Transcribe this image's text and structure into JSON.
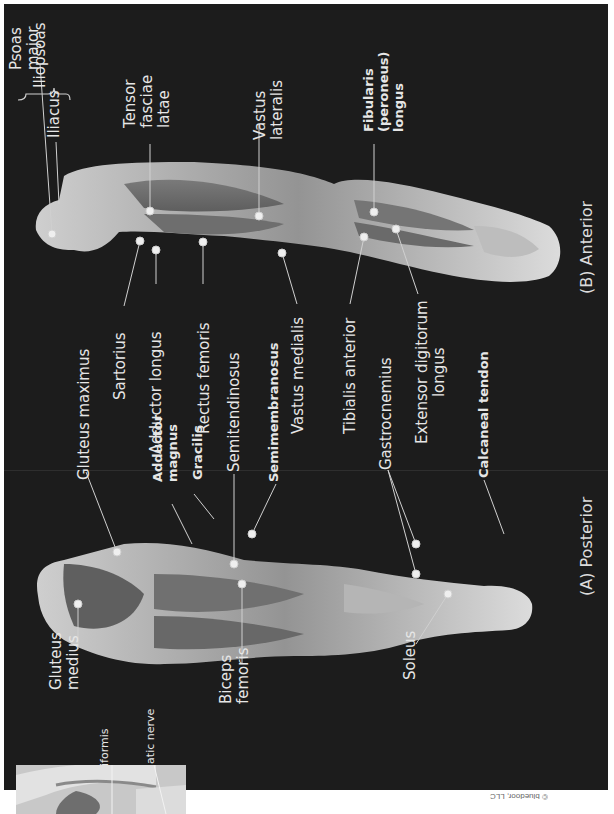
{
  "figure": {
    "background_color": "#1c1c1c",
    "label_color": "#e6e6e6",
    "orientation": "rotated 90 degrees counter-clockwise",
    "views": [
      {
        "id": "anterior",
        "caption": "(B) Anterior",
        "labels": {
          "psoas_major": [
            "Psoas",
            "major"
          ],
          "iliacus": "Iliacus",
          "iliopsoas": "Iliopsoas",
          "tensor_fasciae_latae": [
            "Tensor",
            "fasciae",
            "latae"
          ],
          "vastus_lateralis": [
            "Vastus",
            "lateralis"
          ],
          "fibularis_longus": [
            "Fibularis",
            "(peroneus)",
            "longus"
          ],
          "sartorius": "Sartorius",
          "adductor_longus": "Adductor longus",
          "rectus_femoris": "Rectus femoris",
          "vastus_medialis": "Vastus medialis",
          "tibialis_anterior": "Tibialis anterior",
          "extensor_digitorum_longus": [
            "Extensor digitorum",
            "longus"
          ]
        }
      },
      {
        "id": "posterior",
        "caption": "(A) Posterior",
        "labels": {
          "gluteus_maximus": "Gluteus maximus",
          "adductor_magnus": [
            "Adductor",
            "magnus"
          ],
          "gracilis": "Gracilis",
          "semitendinosus": "Semitendinosus",
          "semimembranosus": "Semimembranosus",
          "gastrocnemius": "Gastrocnemius",
          "calcaneal_tendon": "Calcaneal tendon",
          "gluteus_medius": [
            "Gluteus",
            "medius"
          ],
          "biceps_femoris": [
            "Biceps",
            "femoris"
          ],
          "soleus": "Soleus"
        }
      }
    ],
    "inset": {
      "labels": {
        "piriformis": "Piriformis",
        "sciatic_nerve": "Sciatic nerve"
      }
    },
    "copyright": "© bluedoor, LLC"
  }
}
